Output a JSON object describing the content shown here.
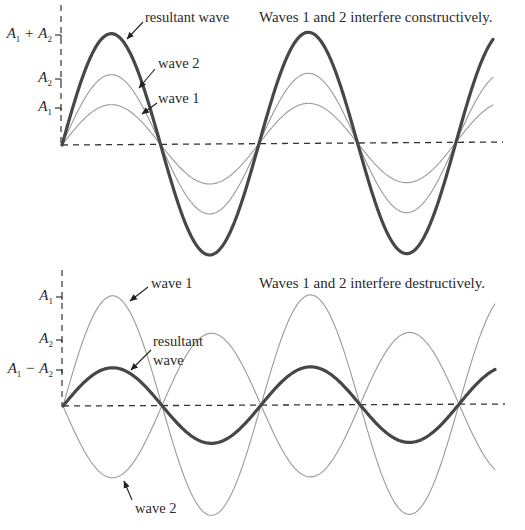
{
  "panels": [
    {
      "id": "constructive",
      "title": "Waves 1 and 2 interfere constructively.",
      "axis": {
        "x0": 62,
        "y0": 145,
        "x_end": 503,
        "y_end_right": 142,
        "y_top": 5
      },
      "half_period": 98.5,
      "x_stop": 493,
      "waves": [
        {
          "name": "wave 1",
          "amplitude": 40,
          "color": "#9a9a9a",
          "width": 1.1
        },
        {
          "name": "wave 2",
          "amplitude": 70,
          "color": "#9a9a9a",
          "width": 1.1
        },
        {
          "name": "resultant wave",
          "amplitude": 111,
          "color": "#474747",
          "width": 3.2
        }
      ],
      "amp_labels": [
        {
          "parts": [
            "A",
            "1",
            "+",
            "A",
            "2"
          ],
          "y": 35
        },
        {
          "parts": [
            "A",
            "2"
          ],
          "y": 79
        },
        {
          "parts": [
            "A",
            "1"
          ],
          "y": 108
        }
      ],
      "labels": [
        {
          "text": "resultant wave",
          "x": 145,
          "y": 10,
          "arrow": [
            143,
            22,
            127,
            39
          ]
        },
        {
          "text": "wave 2",
          "x": 158,
          "y": 55,
          "arrow": [
            155,
            69,
            139,
            88
          ]
        },
        {
          "text": "wave 1",
          "x": 158,
          "y": 91,
          "arrow": [
            157,
            103,
            142,
            114
          ]
        }
      ],
      "title_pos": {
        "x": 259,
        "y": 10
      }
    },
    {
      "id": "destructive",
      "title": "Waves 1 and 2 interfere destructively.",
      "axis": {
        "x0": 63,
        "y0": 406,
        "x_end": 505,
        "y_end_right": 404,
        "y_top": 270
      },
      "half_period": 99,
      "x_stop": 495,
      "waves": [
        {
          "name": "wave 1",
          "amplitude": 110,
          "color": "#9a9a9a",
          "width": 1.1
        },
        {
          "name": "wave 2",
          "amplitude": -72,
          "color": "#9a9a9a",
          "width": 1.1
        },
        {
          "name": "resultant wave",
          "amplitude": 38,
          "color": "#474747",
          "width": 3.2
        }
      ],
      "amp_labels": [
        {
          "parts": [
            "A",
            "1"
          ],
          "y": 297
        },
        {
          "parts": [
            "A",
            "2"
          ],
          "y": 340
        },
        {
          "parts": [
            "A",
            "1",
            "−",
            "A",
            "2"
          ],
          "y": 370
        }
      ],
      "labels": [
        {
          "text": "wave 1",
          "x": 151,
          "y": 276,
          "arrow": [
            148,
            287,
            130,
            301
          ]
        },
        {
          "text": "resultant",
          "x": 153,
          "y": 334,
          "arrow": null
        },
        {
          "text": "wave",
          "x": 153,
          "y": 353,
          "arrow": [
            151,
            350,
            131,
            370
          ]
        },
        {
          "text": "wave 2",
          "x": 135,
          "y": 501,
          "arrow": [
            132,
            500,
            124,
            481
          ]
        }
      ],
      "title_pos": {
        "x": 259,
        "y": 276
      }
    }
  ],
  "constructive": {
    "title": "Waves 1 and 2 interfere constructively.",
    "label_resultant": "resultant wave",
    "label_wave2": "wave 2",
    "label_wave1": "wave 1"
  },
  "destructive": {
    "title": "Waves 1 and 2 interfere destructively.",
    "label_wave1": "wave 1",
    "label_resultant_1": "resultant",
    "label_resultant_2": "wave",
    "label_wave2": "wave 2"
  }
}
